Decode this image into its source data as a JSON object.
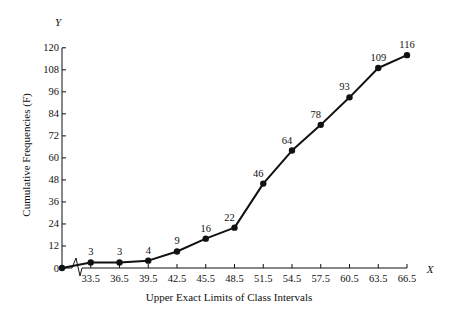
{
  "chart_data": {
    "type": "line",
    "title": "",
    "xlabel": "Upper Exact Limits of Class Intervals",
    "ylabel": "Cumulative Frequencies (F)",
    "x_axis_letter": "X",
    "y_axis_letter": "Y",
    "x": [
      30.5,
      33.5,
      36.5,
      39.5,
      42.5,
      45.5,
      48.5,
      51.5,
      54.5,
      57.5,
      60.5,
      63.5,
      66.5
    ],
    "x_tick_labels": [
      "33.5",
      "36.5",
      "39.5",
      "42.5",
      "45.5",
      "48.5",
      "51.5",
      "54.5",
      "57.5",
      "60.5",
      "63.5",
      "66.5"
    ],
    "y_ticks": [
      0,
      12,
      24,
      36,
      48,
      60,
      72,
      84,
      96,
      108,
      120
    ],
    "ylim": [
      0,
      120
    ],
    "series": [
      {
        "name": "Cumulative Frequencies",
        "values": [
          0,
          3,
          3,
          4,
          9,
          16,
          22,
          46,
          64,
          78,
          93,
          109,
          116
        ],
        "labels": [
          "",
          "3",
          "3",
          "4",
          "9",
          "16",
          "22",
          "46",
          "64",
          "78",
          "93",
          "109",
          "116"
        ]
      }
    ],
    "grid": false,
    "legend": "none",
    "axis_break": true
  }
}
